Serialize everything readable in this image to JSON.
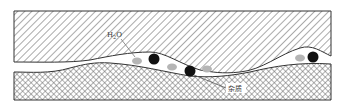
{
  "diagram": {
    "title": "",
    "labels": {
      "water": "H₂O",
      "water_base": "H",
      "water_sub": "2",
      "water_tail": "O",
      "impurity": "杂质"
    },
    "layers": [
      {
        "name": "upper-layer",
        "pattern": "diagonal-hatch"
      },
      {
        "name": "lower-layer",
        "pattern": "cross-hatch"
      }
    ],
    "particles": {
      "impurities": [
        {
          "cx": 154,
          "cy": 59,
          "r": 5.5
        },
        {
          "cx": 190,
          "cy": 71,
          "r": 5.5
        },
        {
          "cx": 313,
          "cy": 57,
          "r": 5.5
        }
      ],
      "water_droplets": [
        {
          "cx": 137,
          "cy": 61,
          "rx": 5,
          "ry": 3.5
        },
        {
          "cx": 172,
          "cy": 67,
          "rx": 5,
          "ry": 3.5
        },
        {
          "cx": 207,
          "cy": 69,
          "rx": 5,
          "ry": 3.5
        },
        {
          "cx": 300,
          "cy": 58,
          "rx": 5,
          "ry": 3.5
        }
      ]
    },
    "colors": {
      "hatch": "#555555",
      "outline": "#333333",
      "impurity": "#111111",
      "water": "#b5b5b5",
      "background": "#ffffff"
    }
  }
}
